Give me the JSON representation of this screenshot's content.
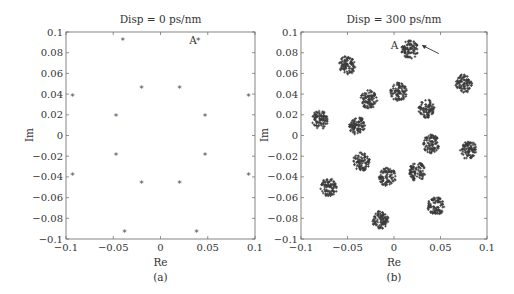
{
  "chart_data": [
    {
      "type": "scatter",
      "panel": "(a)",
      "title": "Disp = 0 ps/nm",
      "xlabel": "Re",
      "ylabel": "Im",
      "xlim": [
        -0.1,
        0.1
      ],
      "ylim": [
        -0.1,
        0.1
      ],
      "xticks": [
        "-0.1",
        "-0.05",
        "0",
        "0.05",
        "0.1"
      ],
      "yticks": [
        "0.1",
        "0.08",
        "0.06",
        "0.04",
        "0.02",
        "0",
        "-0.02",
        "-0.04",
        "-0.06",
        "-0.08",
        "-0.1"
      ],
      "grid": false,
      "marker": "*",
      "annotation": {
        "text": "A",
        "x": 0.04,
        "y": 0.092
      },
      "points": [
        [
          -0.04,
          0.092
        ],
        [
          0.04,
          0.092
        ],
        [
          -0.093,
          0.038
        ],
        [
          0.093,
          0.038
        ],
        [
          -0.02,
          0.046
        ],
        [
          0.02,
          0.046
        ],
        [
          -0.047,
          0.019
        ],
        [
          0.047,
          0.019
        ],
        [
          -0.047,
          -0.019
        ],
        [
          0.047,
          -0.019
        ],
        [
          -0.02,
          -0.046
        ],
        [
          0.02,
          -0.046
        ],
        [
          -0.093,
          -0.038
        ],
        [
          0.093,
          -0.038
        ],
        [
          -0.038,
          -0.093
        ],
        [
          0.038,
          -0.093
        ]
      ]
    },
    {
      "type": "scatter",
      "panel": "(b)",
      "title": "Disp = 300 ps/nm",
      "xlabel": "Re",
      "ylabel": "Im",
      "xlim": [
        -0.1,
        0.1
      ],
      "ylim": [
        -0.1,
        0.1
      ],
      "xticks": [
        "-0.1",
        "-0.05",
        "0",
        "0.05",
        "0.1"
      ],
      "yticks": [
        "0.1",
        "0.08",
        "0.06",
        "0.04",
        "0.02",
        "0",
        "-0.02",
        "-0.04",
        "-0.06",
        "-0.08",
        "-0.1"
      ],
      "grid": false,
      "marker": "+",
      "annotation": {
        "text": "A",
        "x": 0.017,
        "y": 0.083,
        "arrow": true
      },
      "cluster_radius": 0.009,
      "cluster_centers": [
        [
          0.017,
          0.083
        ],
        [
          -0.05,
          0.068
        ],
        [
          0.075,
          0.05
        ],
        [
          -0.027,
          0.035
        ],
        [
          0.005,
          0.042
        ],
        [
          0.035,
          0.026
        ],
        [
          -0.08,
          0.015
        ],
        [
          -0.04,
          0.01
        ],
        [
          0.04,
          -0.008
        ],
        [
          0.08,
          -0.014
        ],
        [
          -0.035,
          -0.025
        ],
        [
          -0.007,
          -0.04
        ],
        [
          0.025,
          -0.035
        ],
        [
          -0.07,
          -0.05
        ],
        [
          0.045,
          -0.068
        ],
        [
          -0.015,
          -0.082
        ]
      ]
    }
  ],
  "panels": {
    "a": {
      "title": "Disp = 0 ps/nm",
      "xlabel": "Re",
      "ylabel": "Im",
      "caption": "(a)",
      "annot": "A"
    },
    "b": {
      "title": "Disp = 300 ps/nm",
      "xlabel": "Re",
      "ylabel": "Im",
      "caption": "(b)",
      "annot": "A"
    }
  },
  "colors": {
    "axis": "#555555",
    "marker": "#444444",
    "cluster": "#3a3a3a"
  }
}
